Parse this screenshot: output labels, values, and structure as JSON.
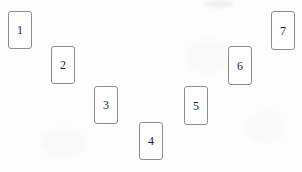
{
  "scene": {
    "title": "Numbered cards arranged in an arc",
    "width": 302,
    "height": 172,
    "background_color": "#fdfdfd",
    "card_border_color": "#8e8e8e",
    "card_fill_color": "#fefefe",
    "label_color": "#1e1e1e"
  },
  "cards": [
    {
      "label": "1",
      "name": "card-1",
      "x": 8,
      "y": 11,
      "width": 24,
      "height": 38
    },
    {
      "label": "2",
      "name": "card-2",
      "x": 51,
      "y": 46,
      "width": 24,
      "height": 38
    },
    {
      "label": "3",
      "name": "card-3",
      "x": 94,
      "y": 86,
      "width": 24,
      "height": 38
    },
    {
      "label": "4",
      "name": "card-4",
      "x": 139,
      "y": 122,
      "width": 24,
      "height": 38
    },
    {
      "label": "5",
      "name": "card-5",
      "x": 184,
      "y": 86,
      "width": 24,
      "height": 39
    },
    {
      "label": "6",
      "name": "card-6",
      "x": 228,
      "y": 46,
      "width": 24,
      "height": 39
    },
    {
      "label": "7",
      "name": "card-7",
      "x": 271,
      "y": 11,
      "width": 24,
      "height": 39
    }
  ]
}
